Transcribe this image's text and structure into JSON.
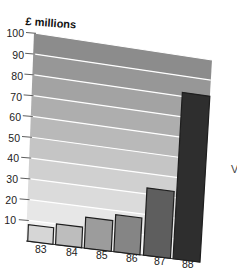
{
  "chart_data": {
    "type": "bar",
    "title": "",
    "ylabel": "£ millions",
    "xlabel": "",
    "categories": [
      "83",
      "84",
      "85",
      "86",
      "87",
      "88"
    ],
    "values": [
      8,
      10,
      15,
      18,
      33,
      82
    ],
    "ylim": [
      0,
      100
    ],
    "yticks": [
      10,
      20,
      30,
      40,
      50,
      60,
      70,
      80,
      90,
      100
    ],
    "grid": true,
    "legend": null,
    "style_hints": {
      "perspective_tilt": true,
      "background_gradient": "horizontal bands darkening from light at bottom to mid-grey at top",
      "bar_colors": [
        "#d6d6d6",
        "#bdbdbd",
        "#9c9c9c",
        "#858585",
        "#5e5e5e",
        "#2e2e2e"
      ]
    }
  },
  "labels": {
    "y_axis_title": "£ millions",
    "y_ticks": [
      "100",
      "90",
      "80",
      "70",
      "60",
      "50",
      "40",
      "30",
      "20",
      "10"
    ],
    "x_ticks": [
      "83",
      "84",
      "85",
      "86",
      "87",
      "88"
    ],
    "edge_glyph": "V"
  },
  "colors": {
    "band_top": "#8c8c8c",
    "band_bottom": "#f2f2f2",
    "gridline": "#ffffff",
    "tickline": "#333333",
    "bar_outline": "#1e1e1e"
  }
}
